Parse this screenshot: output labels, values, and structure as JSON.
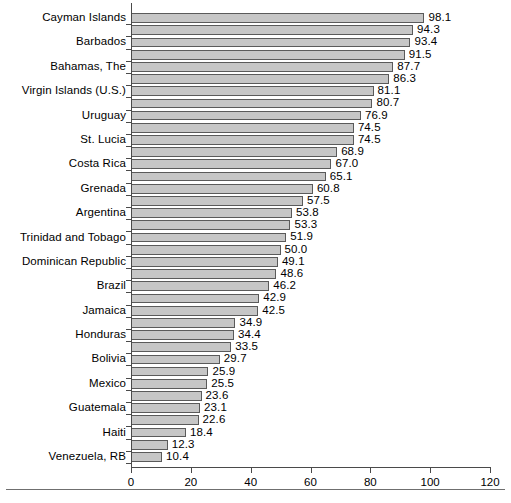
{
  "chart_data": {
    "type": "bar",
    "orientation": "horizontal",
    "title": "",
    "subtitle": "",
    "xlabel": "",
    "ylabel": "",
    "xlim": [
      0,
      120
    ],
    "xticks": [
      0,
      20,
      40,
      60,
      80,
      100,
      120
    ],
    "grid": false,
    "legend": null,
    "bar_color": "#c6c6c6",
    "bar_border_color": "#5a5a5a",
    "axis_color": "#4a4a4a",
    "label_every_nth_category": 2,
    "categories": [
      "Cayman Islands",
      "",
      "Barbados",
      "",
      "Bahamas, The",
      "",
      "Virgin Islands (U.S.)",
      "",
      "Uruguay",
      "",
      "St. Lucia",
      "",
      "Costa Rica",
      "",
      "Grenada",
      "",
      "Argentina",
      "",
      "Trinidad and Tobago",
      "",
      "Dominican Republic",
      "",
      "Brazil",
      "",
      "Jamaica",
      "",
      "Honduras",
      "",
      "Bolivia",
      "",
      "Mexico",
      "",
      "Guatemala",
      "",
      "Haiti",
      "",
      "Venezuela, RB"
    ],
    "values": [
      98.1,
      94.3,
      93.4,
      91.5,
      87.7,
      86.3,
      81.1,
      80.7,
      76.9,
      74.5,
      74.5,
      68.9,
      67.0,
      65.1,
      60.8,
      57.5,
      53.8,
      53.3,
      51.9,
      50.0,
      49.1,
      48.6,
      46.2,
      42.9,
      42.5,
      34.9,
      34.4,
      33.5,
      29.7,
      25.9,
      25.5,
      23.6,
      23.1,
      22.6,
      18.4,
      12.3,
      10.4
    ],
    "value_labels": [
      "98.1",
      "94.3",
      "93.4",
      "91.5",
      "87.7",
      "86.3",
      "81.1",
      "80.7",
      "76.9",
      "74.5",
      "74.5",
      "68.9",
      "67.0",
      "65.1",
      "60.8",
      "57.5",
      "53.8",
      "53.3",
      "51.9",
      "50.0",
      "49.1",
      "48.6",
      "46.2",
      "42.9",
      "42.5",
      "34.9",
      "34.4",
      "33.5",
      "29.7",
      "25.9",
      "25.5",
      "23.6",
      "23.1",
      "22.6",
      "18.4",
      "12.3",
      "10.4"
    ],
    "xtick_labels": [
      "0",
      "20",
      "40",
      "60",
      "80",
      "100",
      "120"
    ]
  }
}
